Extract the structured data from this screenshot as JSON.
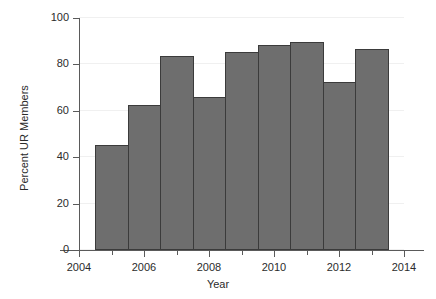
{
  "chart_data": {
    "type": "bar",
    "title": "",
    "xlabel": "Year",
    "ylabel": "Percent UR Members",
    "categories": [
      2005,
      2006,
      2007,
      2008,
      2009,
      2010,
      2011,
      2012,
      2013
    ],
    "values": [
      45.3,
      62.5,
      83.5,
      66.0,
      85.3,
      88.2,
      89.5,
      72.5,
      86.8
    ],
    "series": [
      {
        "name": "Percent UR Members",
        "values": [
          45.3,
          62.5,
          83.5,
          66.0,
          85.3,
          88.2,
          89.5,
          72.5,
          86.8
        ]
      }
    ],
    "xlim": [
      2004,
      2014
    ],
    "ylim": [
      0,
      100
    ],
    "bar_span": [
      2004.5,
      2013.5
    ],
    "x_ticks": [
      2004,
      2006,
      2008,
      2010,
      2012,
      2014
    ],
    "x_tick_labels": [
      "2004",
      "2006",
      "2008",
      "2010",
      "2012",
      "2014"
    ],
    "x_minor_ticks": [
      2005,
      2007,
      2009,
      2011,
      2013
    ],
    "y_ticks": [
      0,
      20,
      40,
      60,
      80,
      100
    ],
    "y_tick_labels": [
      "0",
      "20",
      "40",
      "60",
      "80",
      "100"
    ],
    "grid": "horizontal",
    "legend": null,
    "colors": {
      "bar_fill": "#6e6e6e",
      "bar_edge": "#3b3b3b",
      "grid": "#f0f0f0",
      "axis": "#5a5a5a",
      "text": "#2b2b2b",
      "background": "#ffffff"
    }
  }
}
